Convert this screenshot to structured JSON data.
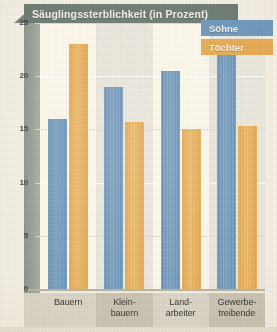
{
  "chart_data": {
    "type": "bar",
    "title": "Säuglingssterblichkeit (in Prozent)",
    "xlabel": "",
    "ylabel": "",
    "ylim": [
      0,
      25
    ],
    "yticks": [
      "0",
      "5",
      "10",
      "15",
      "20",
      "25"
    ],
    "grid": true,
    "legend_position": "top-right",
    "categories": [
      "Bauern",
      "Klein-\nbauern",
      "Land-\narbeiter",
      "Gewerbe-\ntreibende"
    ],
    "category_lines": [
      [
        "Bauern",
        ""
      ],
      [
        "Klein-",
        "bauern"
      ],
      [
        "Land-",
        "arbeiter"
      ],
      [
        "Gewerbe-",
        "treibende"
      ]
    ],
    "series": [
      {
        "name": "Söhne",
        "color": "#6d94b6",
        "values": [
          16.0,
          19.0,
          20.5,
          22.0
        ]
      },
      {
        "name": "Töchter",
        "color": "#e5ab55",
        "values": [
          23.0,
          15.7,
          15.0,
          15.3
        ]
      }
    ]
  },
  "legend": {
    "items": [
      {
        "label": "Söhne",
        "color": "#7099bb"
      },
      {
        "label": "Töchter",
        "color": "#e5ab55"
      }
    ]
  },
  "colors": {
    "banner": "#6f7d72",
    "axis_band": "#97a096",
    "plot_background": "#fbf7ea",
    "column_band": "#e9e6dc",
    "sons": "#6d94b6",
    "daughters": "#e5ab55",
    "xaxis_background": "#d9d4c6",
    "page": "#f3eee2"
  }
}
